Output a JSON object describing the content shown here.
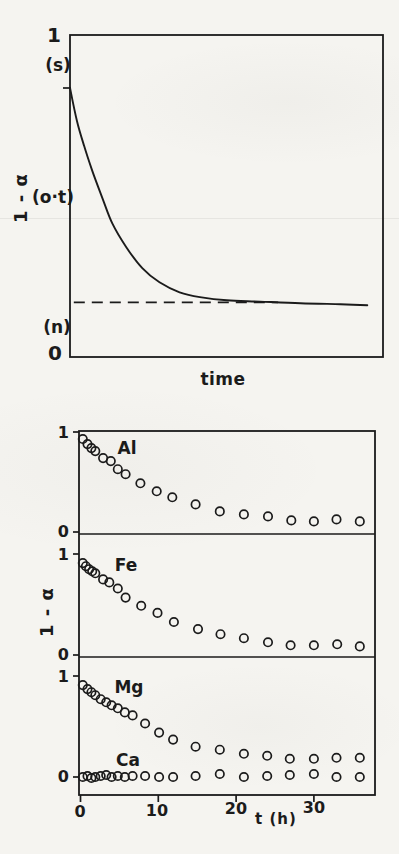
{
  "page": {
    "background": "#f5f4f0",
    "ink": "#1b1b1b"
  },
  "chart_data": [
    {
      "id": "schematic-decay",
      "type": "line",
      "title": "",
      "xlabel": "time",
      "ylabel": "1 - α",
      "ylim": [
        0,
        1
      ],
      "yticks": [
        "1",
        "0"
      ],
      "grid": false,
      "annotations": [
        {
          "id": "s",
          "text": "(s)"
        },
        {
          "id": "ot",
          "text": "(o·t)"
        },
        {
          "id": "n",
          "text": "(n)"
        }
      ],
      "curve_start_value": 0.84,
      "asymptote_value": 0.17,
      "curve": {
        "x_frac": [
          0.0,
          0.022,
          0.045,
          0.071,
          0.103,
          0.135,
          0.18,
          0.231,
          0.286,
          0.35,
          0.415,
          0.501,
          0.607,
          0.736,
          0.864,
          0.95
        ],
        "y": [
          0.836,
          0.734,
          0.656,
          0.579,
          0.495,
          0.415,
          0.341,
          0.276,
          0.232,
          0.201,
          0.186,
          0.176,
          0.172,
          0.167,
          0.164,
          0.161
        ]
      },
      "dashed_asymptote": {
        "value": 0.17,
        "x_frac_start": 0.012,
        "x_frac_end": 0.665
      }
    },
    {
      "id": "element-release",
      "type": "scatter",
      "title": "",
      "xlabel": "t (h)",
      "ylabel": "1 - α",
      "xlim": [
        0,
        38
      ],
      "xticks": [
        0,
        10,
        20,
        30
      ],
      "panel_yticks": [
        "1",
        "0"
      ],
      "ylim_per_panel": [
        0,
        1
      ],
      "grid": false,
      "panels": [
        {
          "label": "Al",
          "panel_index": 0,
          "t": [
            0.3,
            0.9,
            1.4,
            1.9,
            2.9,
            3.9,
            4.8,
            5.8,
            7.7,
            9.8,
            11.8,
            14.8,
            17.9,
            21.0,
            24.1,
            27.1,
            30.0,
            32.9,
            35.9
          ],
          "v": [
            0.93,
            0.88,
            0.84,
            0.81,
            0.74,
            0.71,
            0.63,
            0.58,
            0.49,
            0.41,
            0.35,
            0.28,
            0.21,
            0.18,
            0.16,
            0.12,
            0.11,
            0.13,
            0.11
          ]
        },
        {
          "label": "Fe",
          "panel_index": 1,
          "t": [
            0.3,
            0.7,
            1.1,
            1.5,
            1.9,
            2.9,
            3.7,
            4.8,
            5.8,
            7.8,
            9.9,
            12.0,
            15.1,
            18.0,
            21.0,
            24.1,
            27.0,
            30.0,
            33.0,
            35.9
          ],
          "v": [
            0.91,
            0.88,
            0.85,
            0.83,
            0.81,
            0.75,
            0.72,
            0.66,
            0.57,
            0.49,
            0.42,
            0.33,
            0.26,
            0.21,
            0.17,
            0.13,
            0.1,
            0.1,
            0.11,
            0.09
          ]
        },
        {
          "label": "Mg",
          "panel_index": 2,
          "t": [
            0.3,
            0.9,
            1.4,
            1.9,
            2.6,
            3.3,
            4.0,
            4.8,
            5.7,
            6.7,
            8.3,
            10.1,
            11.9,
            14.8,
            17.9,
            21.0,
            24.0,
            26.9,
            30.0,
            32.9,
            35.9
          ],
          "v": [
            0.91,
            0.87,
            0.84,
            0.81,
            0.77,
            0.74,
            0.71,
            0.68,
            0.64,
            0.61,
            0.53,
            0.44,
            0.37,
            0.3,
            0.27,
            0.23,
            0.21,
            0.18,
            0.18,
            0.19,
            0.19
          ]
        },
        {
          "label": "Ca",
          "panel_index": 2,
          "t": [
            0.3,
            0.9,
            1.4,
            1.9,
            2.6,
            3.3,
            4.0,
            4.8,
            5.7,
            6.7,
            8.3,
            10.1,
            11.9,
            14.8,
            17.9,
            21.0,
            24.0,
            26.9,
            30.0,
            32.9,
            35.9
          ],
          "v": [
            0.0,
            0.01,
            -0.01,
            0.0,
            0.01,
            0.02,
            0.0,
            0.01,
            0.0,
            0.01,
            0.01,
            0.0,
            0.0,
            0.01,
            0.03,
            0.0,
            0.01,
            0.02,
            0.03,
            0.0,
            0.0
          ]
        }
      ]
    }
  ]
}
